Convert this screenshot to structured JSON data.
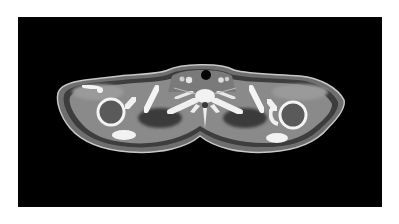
{
  "image": {
    "description": "Axial CT slice through shoulders and upper thorax",
    "background_color": "#ffffff",
    "frame_color": "#000000"
  },
  "colors": {
    "skin": "#b4b4b4",
    "fat": "#4a4a4a",
    "muscle": "#8c8c8c",
    "bone": "#f2f2f2",
    "air": "#050505",
    "vessel": "#e0e0e0"
  }
}
